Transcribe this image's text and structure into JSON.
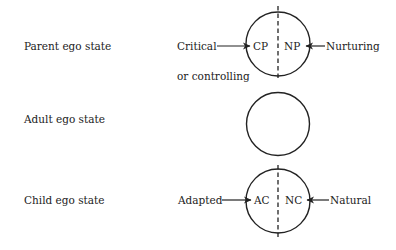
{
  "diagram": {
    "type": "ego-state-model",
    "stroke_color": "#222222",
    "background": "#ffffff",
    "rows": [
      {
        "id": "parent",
        "label": "Parent ego state",
        "circle": {
          "cx": 278,
          "cy": 44,
          "r": 32,
          "divided": true
        },
        "left_inner": "CP",
        "right_inner": "NP",
        "left_outer": "Critical",
        "left_outer_line2": "or controlling",
        "right_outer": "Nurturing"
      },
      {
        "id": "adult",
        "label": "Adult ego state",
        "circle": {
          "cx": 278,
          "cy": 124,
          "r": 31,
          "divided": false
        }
      },
      {
        "id": "child",
        "label": "Child ego state",
        "circle": {
          "cx": 278,
          "cy": 201,
          "r": 32,
          "divided": true
        },
        "left_inner": "AC",
        "right_inner": "NC",
        "left_outer": "Adapted",
        "right_outer": "Natural"
      }
    ]
  }
}
